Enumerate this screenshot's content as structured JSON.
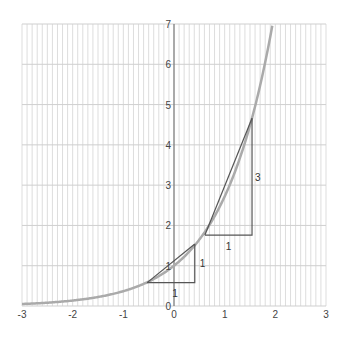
{
  "chart_data": {
    "type": "line",
    "title": "",
    "xlabel": "",
    "ylabel": "",
    "xlim": [
      -3,
      3
    ],
    "ylim": [
      0,
      7
    ],
    "grid": {
      "vertical_minor_step": 0.1,
      "horizontal_step": 1
    },
    "x_ticks": [
      "-3",
      "-2",
      "-1",
      "0",
      "1",
      "2",
      "3"
    ],
    "y_ticks": [
      "0",
      "1",
      "2",
      "3",
      "4",
      "5",
      "6",
      "7"
    ],
    "series": [
      {
        "name": "y = e^x",
        "function": "exp",
        "x_range": [
          -3,
          1.95
        ],
        "color": "#aaaaaa"
      }
    ],
    "annotations": {
      "small_triangle": {
        "start": [
          -0.53,
          0.58
        ],
        "corner": [
          0.41,
          0.58
        ],
        "end": [
          0.41,
          1.54
        ],
        "run_label": "1",
        "rise_label": "1"
      },
      "large_triangle": {
        "start": [
          0.61,
          1.76
        ],
        "corner": [
          1.54,
          1.76
        ],
        "end": [
          1.54,
          4.66
        ],
        "run_label": "1",
        "rise_label": "3"
      },
      "point_label": "1"
    },
    "colors": {
      "curve": "#aaaaaa",
      "lines": "#555555",
      "grid": "#dddddd"
    }
  }
}
